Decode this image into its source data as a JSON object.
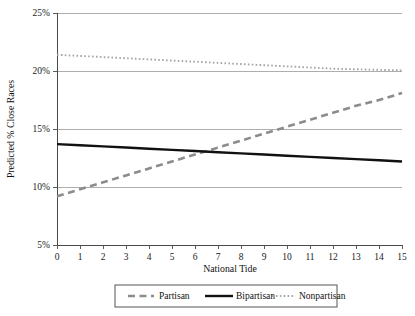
{
  "chart_data": {
    "type": "line",
    "title": "",
    "xlabel": "National Tide",
    "ylabel": "Predicted % Close Races",
    "xlim": [
      0,
      15
    ],
    "ylim": [
      5,
      25
    ],
    "grid": true,
    "legend_position": "bottom",
    "x": [
      0,
      1,
      2,
      3,
      4,
      5,
      6,
      7,
      8,
      9,
      10,
      11,
      12,
      13,
      14,
      15
    ],
    "xtick_labels": [
      "0",
      "1",
      "2",
      "3",
      "4",
      "5",
      "6",
      "7",
      "8",
      "9",
      "10",
      "11",
      "12",
      "13",
      "14",
      "15"
    ],
    "ytick_labels": [
      "25%",
      "20%",
      "15%",
      "10%",
      "5%"
    ],
    "ytick_values": [
      25,
      20,
      15,
      10,
      5
    ],
    "series": [
      {
        "name": "Partisan",
        "style": "dashed",
        "color": "#8c8c8c",
        "values": [
          9.2,
          9.8,
          10.4,
          11.0,
          11.6,
          12.2,
          12.8,
          13.4,
          14.0,
          14.6,
          15.2,
          15.8,
          16.4,
          17.0,
          17.5,
          18.1
        ]
      },
      {
        "name": "Bipartisan",
        "style": "solid",
        "color": "#111111",
        "values": [
          13.7,
          13.6,
          13.5,
          13.4,
          13.3,
          13.2,
          13.1,
          13.0,
          12.9,
          12.8,
          12.7,
          12.6,
          12.5,
          12.4,
          12.3,
          12.2
        ]
      },
      {
        "name": "Nonpartisan",
        "style": "dotted",
        "color": "#a5a5a5",
        "values": [
          21.4,
          21.3,
          21.2,
          21.1,
          21.0,
          20.9,
          20.8,
          20.7,
          20.6,
          20.5,
          20.4,
          20.3,
          20.2,
          20.15,
          20.1,
          20.05
        ]
      }
    ]
  },
  "legend": {
    "items": [
      {
        "label": "Partisan"
      },
      {
        "label": "Bipartisan"
      },
      {
        "label": "Nonpartisan"
      }
    ]
  }
}
